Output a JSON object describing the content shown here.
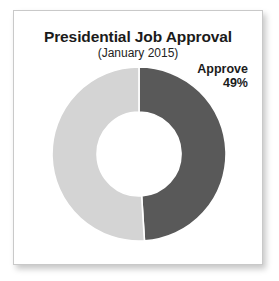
{
  "card": {
    "background": "#ffffff",
    "border_color": "#c9c9c9"
  },
  "header": {
    "title": "Presidential Job Approval",
    "subtitle": "(January 2015)"
  },
  "callout": {
    "name": "Approve",
    "value": "49%"
  },
  "chart_data": {
    "type": "pie",
    "variant": "donut",
    "title": "Presidential Job Approval",
    "subtitle": "(January 2015)",
    "categories": [
      "Approve",
      "Disapprove"
    ],
    "values": [
      49,
      51
    ],
    "unit": "%",
    "colors": [
      "#595959",
      "#d4d4d4"
    ],
    "labels": [
      {
        "text": "Approve",
        "value": "49%",
        "series": "Approve",
        "position": "outside-upper-right"
      }
    ],
    "legend": "none",
    "grid": false,
    "start_angle_deg": 0,
    "direction": "clockwise",
    "inner_radius_ratio": 0.48,
    "geometry": {
      "center_x": 88,
      "center_y": 88,
      "outer_radius": 87,
      "inner_radius": 42
    }
  }
}
